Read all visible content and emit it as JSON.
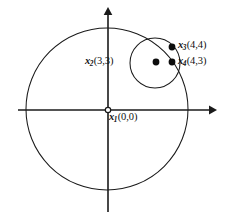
{
  "figure": {
    "type": "geometry-diagram",
    "background_color": "#ffffff",
    "stroke_color": "#1a1a1a",
    "width": 225,
    "height": 218,
    "axes": {
      "x_axis": {
        "label": "",
        "arrow_direction": "right",
        "y_pixel": 110
      },
      "y_axis": {
        "label": "",
        "arrow_direction": "up",
        "x_pixel": 108
      }
    },
    "circles": [
      {
        "name": "large-circle",
        "center_label": "x1",
        "cx": 107,
        "cy": 109,
        "r": 81
      },
      {
        "name": "small-circle",
        "center_label": "x2",
        "cx": 155,
        "cy": 63,
        "r": 25
      }
    ],
    "points": [
      {
        "id": "x1",
        "symbol": "x",
        "subscript": "1",
        "coords": "(0,0)",
        "x": 0,
        "y": 0,
        "marker": "open-circle",
        "px": 108,
        "py": 110
      },
      {
        "id": "x2",
        "symbol": "x",
        "subscript": "2",
        "coords": "(3,3)",
        "x": 3,
        "y": 3,
        "marker": "filled-dot",
        "px": 156,
        "py": 62
      },
      {
        "id": "x3",
        "symbol": "x",
        "subscript": "3",
        "coords": "(4,4)",
        "x": 4,
        "y": 4,
        "marker": "filled-dot",
        "px": 172,
        "py": 47
      },
      {
        "id": "x4",
        "symbol": "x",
        "subscript": "4",
        "coords": "(4,3)",
        "x": 4,
        "y": 3,
        "marker": "filled-dot",
        "px": 172,
        "py": 62
      }
    ]
  }
}
